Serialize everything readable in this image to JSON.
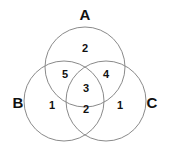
{
  "figure": {
    "type": "venn-diagram",
    "background_color": "#ffffff",
    "stroke_color": "#8a8a8a",
    "text_color": "#111111",
    "width": 171,
    "height": 151
  },
  "sets": [
    {
      "id": "A",
      "label": "A",
      "label_x": 85,
      "label_y": 14,
      "cx": 85,
      "cy": 67,
      "r": 40
    },
    {
      "id": "B",
      "label": "B",
      "label_x": 18,
      "label_y": 102,
      "cx": 64,
      "cy": 101,
      "r": 40
    },
    {
      "id": "C",
      "label": "C",
      "label_x": 152,
      "label_y": 102,
      "cx": 106,
      "cy": 101,
      "r": 40
    }
  ],
  "regions": [
    {
      "id": "A-only",
      "sets": "A",
      "value": "2",
      "x": 85,
      "y": 48
    },
    {
      "id": "A-and-B",
      "sets": "A∩B",
      "value": "5",
      "x": 65,
      "y": 74
    },
    {
      "id": "A-and-C",
      "sets": "A∩C",
      "value": "4",
      "x": 106,
      "y": 74
    },
    {
      "id": "A-B-C",
      "sets": "A∩B∩C",
      "value": "3",
      "x": 86,
      "y": 88
    },
    {
      "id": "B-only",
      "sets": "B",
      "value": "1",
      "x": 52,
      "y": 105
    },
    {
      "id": "C-only",
      "sets": "C",
      "value": "1",
      "x": 120,
      "y": 105
    },
    {
      "id": "B-and-C",
      "sets": "B∩C",
      "value": "2",
      "x": 86,
      "y": 109
    }
  ],
  "chart_data": {
    "type": "venn",
    "title": "",
    "set_labels": [
      "A",
      "B",
      "C"
    ],
    "regions": {
      "A_only": 2,
      "B_only": 1,
      "C_only": 1,
      "A_and_B_only": 5,
      "A_and_C_only": 4,
      "B_and_C_only": 2,
      "A_and_B_and_C": 3
    },
    "totals": {
      "A": 14,
      "B": 11,
      "C": 10,
      "universe": 18
    },
    "legend": "none",
    "grid": false
  }
}
